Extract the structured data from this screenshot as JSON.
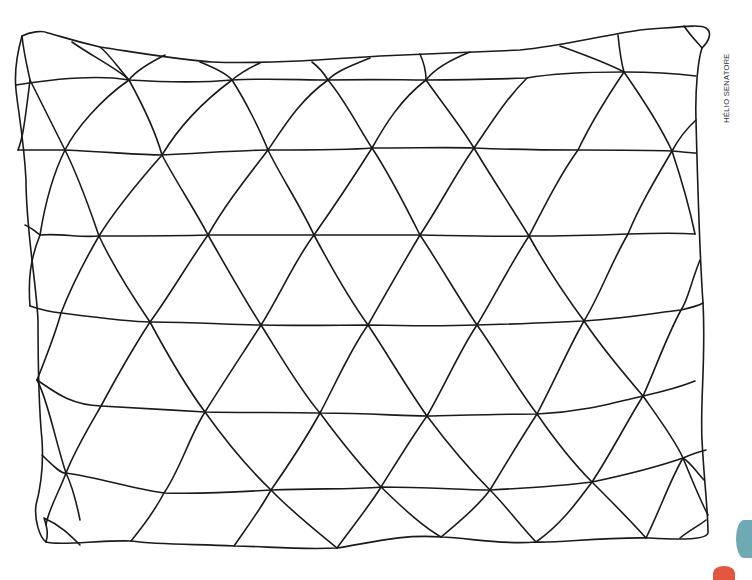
{
  "artwork": {
    "subject": "coloring page - pillow with triangle pattern",
    "credit": "HÉLIO SENATORE",
    "stroke_color": "#1a1a1a",
    "background": "#ffffff",
    "accent_colors": {
      "teal": "#6fa9b3",
      "coral": "#e2553f"
    },
    "paths": [
      "M22,36 C30,32 42,30 48,33 C60,36 70,40 100,47 C140,53 180,60 212,62 C260,64 320,60 380,56 C430,54 470,52 520,50 C560,46 600,36 640,30 C680,27 700,24 706,28 C712,32 710,40 702,48 C698,60 695,90 696,120 C698,200 700,260 703,303 C706,360 700,400 702,440 C704,480 708,510 708,533 C706,540 680,540 650,538 C600,537 560,543 536,542 C500,545 470,538 441,537 C400,534 370,543 337,548 C300,550 260,546 234,546 C200,544 160,545 131,541 C100,540 60,546 46,542 C40,538 34,520 36,505 C40,490 44,470 42,440 C38,400 38,360 38,320 C36,280 26,230 26,180 C24,140 18,110 16,90 C14,70 18,50 22,36 Z",
      "M16,85 C60,78 100,75 129,80 C180,83 210,82 232,80 C270,78 300,80 328,80 C380,79 400,80 426,80 C470,80 500,79 527,78 C560,72 600,72 624,72 C660,72 680,74 696,76",
      "M18,150 C40,150 55,150 65,150 C110,152 140,155 162,155 C220,152 250,150 268,150 C320,150 350,150 372,148 C420,148 450,147 474,148 C520,150 550,150 578,150 C620,150 650,150 672,151 C685,152 690,153 696,153",
      "M25,225 C32,228 36,232 40,235 C60,233 80,238 99,236 C150,236 180,236 208,235 C260,235 290,235 314,235 C360,235 390,235 420,235 C470,236 500,237 529,236 C570,236 600,235 628,234 C660,233 680,233 695,234",
      "M30,306 C42,310 52,312 61,313 C100,318 130,322 150,322 C200,322 230,325 261,325 C310,326 340,325 368,325 C410,326 450,326 477,325 C520,324 560,322 584,321 C630,318 660,312 681,310 C690,308 698,306 703,303",
      "M37,380 C55,392 70,405 101,406 C140,408 170,410 205,412 C250,413 290,412 320,413 C370,413 400,416 427,416 C470,415 510,414 537,414 C580,412 610,404 643,396 C670,390 685,385 695,381",
      "M42,455 C55,468 62,474 66,473 C100,478 130,488 164,493 C200,494 240,492 271,490 C320,488 350,490 381,487 C430,487 460,490 490,490 C530,488 560,486 592,482 C630,474 660,466 683,458 C690,455 698,452 706,450",
      "M22,36 C24,55 28,70 30,80 C45,110 60,140 65,150 C80,180 90,210 99,236 C115,270 135,300 150,322 C165,350 185,385 205,412 C225,440 250,470 271,490 C290,510 315,530 337,548",
      "M72,42 C90,55 120,70 129,80 C140,100 155,130 162,155 C175,180 195,210 208,235 C225,265 245,300 261,325 C280,355 300,390 320,413 C340,440 360,465 381,487 C400,505 420,525 441,537",
      "M200,62 C215,68 228,75 232,80 C245,100 260,130 268,150 C280,175 300,205 314,235 C330,265 350,300 368,325 C385,350 405,385 427,416 C445,440 470,470 490,490 C505,505 520,525 536,542",
      "M312,62 C320,68 325,75 328,80 C345,100 360,130 372,148 C390,175 405,205 420,235 C440,265 460,300 477,325 C495,350 515,385 537,414 C555,440 575,465 592,482 C610,500 630,520 646,538",
      "M420,54 C425,65 426,72 426,80 C440,100 460,125 474,148 C490,175 510,205 529,236 C545,265 565,295 584,321 C600,345 625,375 643,396 C660,420 675,440 683,458 C690,475 700,500 708,515",
      "M560,46 C585,55 605,62 624,72 C640,95 660,125 672,151 C680,175 690,210 695,234",
      "M618,35 C620,55 622,65 624,72",
      "M684,26 C690,35 697,42 702,48",
      "M100,47 C110,55 120,70 129,80 C100,100 75,130 65,150 C50,180 44,210 40,235",
      "M165,55 C145,65 135,72 129,80",
      "M260,63 C245,70 238,75 232,80 C205,100 180,125 162,155 C140,180 115,210 99,236 C85,260 70,290 61,313 C55,335 45,360 37,380",
      "M370,58 C350,66 335,72 328,80 C300,100 285,125 268,150 C245,180 225,205 208,235 C190,260 170,295 150,322 C135,345 115,380 101,406 C90,425 75,450 66,473 C60,490 48,510 46,525",
      "M470,52 C445,62 432,72 426,80 C400,100 385,125 372,148 C355,175 335,205 314,235 C295,260 280,295 261,325 C245,350 225,380 205,412 C190,435 180,470 164,493 C155,510 140,530 131,541",
      "M527,78 C505,100 490,125 474,148 C455,175 440,205 420,235 C405,260 385,295 368,325 C350,350 335,385 320,413 C305,440 285,470 271,490 C260,510 245,530 234,546",
      "M624,72 C605,100 590,125 578,150 C560,175 545,205 529,236 C510,265 495,295 477,325 C460,350 445,385 427,416 C410,440 395,465 381,487 C370,505 350,530 337,548",
      "M696,120 C685,130 678,140 672,151 C655,180 640,205 628,234 C610,265 600,295 584,321 C570,345 555,380 537,414 C520,440 505,465 490,490 C475,510 455,525 441,537",
      "M700,260 C690,285 688,300 681,310 C665,340 655,370 643,396 C625,425 610,455 592,482 C575,505 560,525 536,542",
      "M704,480 C695,470 690,462 683,458 C670,480 660,510 646,538",
      "M706,520 C700,525 690,530 680,538",
      "M18,150 C22,140 24,130 30,80 M40,235 C30,260 28,280 30,306",
      "M37,380 C48,400 55,440 66,473 C74,490 80,520 80,520",
      "M44,518 C48,530 48,535 46,542 M44,518 C60,525 70,535 80,545"
    ]
  }
}
